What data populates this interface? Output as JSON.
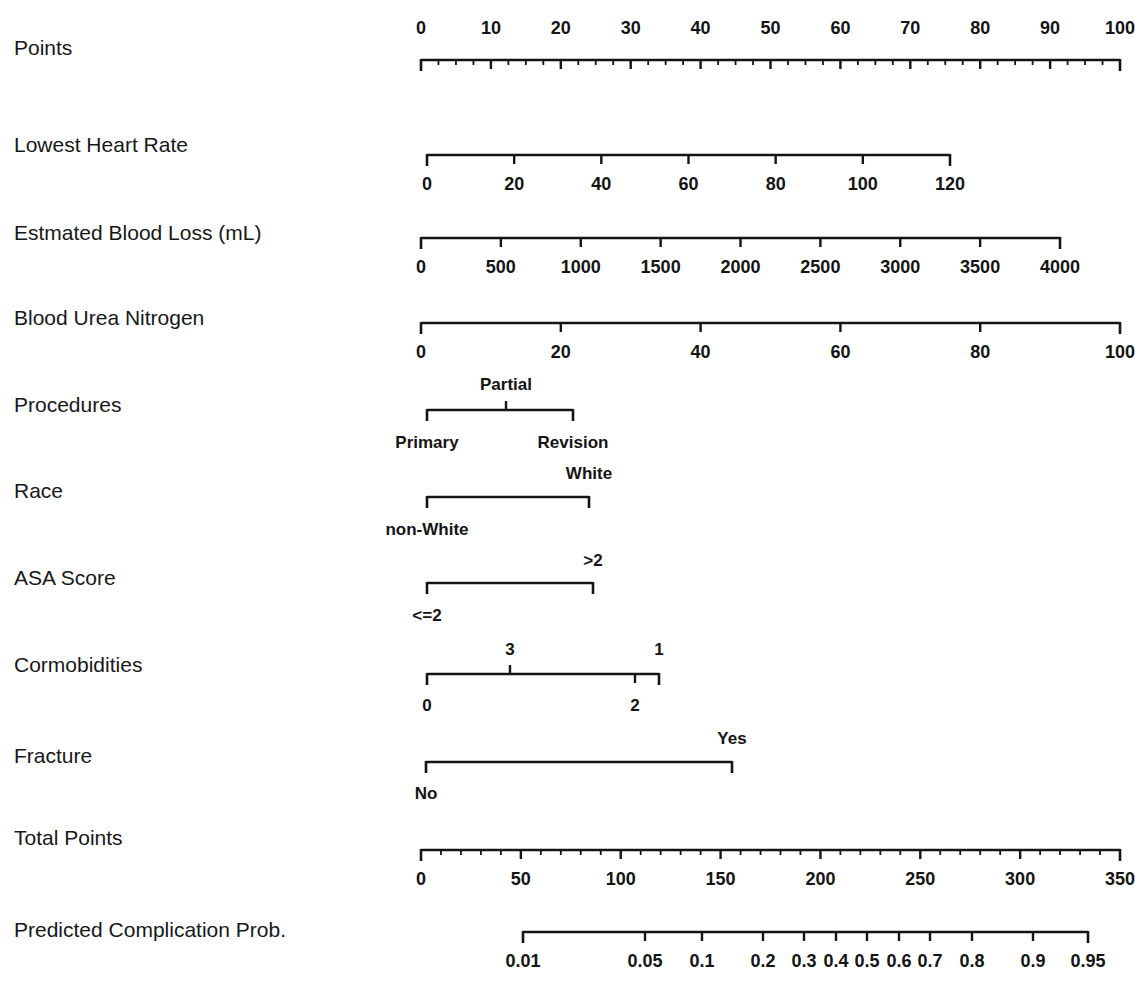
{
  "figure": {
    "background_color": "#ffffff",
    "ink_color": "#141414",
    "width": 1135,
    "height": 989
  },
  "rows": [
    {
      "key": "points",
      "label": "Points",
      "label_x": 14,
      "label_y": 55,
      "axis_y": 60,
      "tick_dir": "down",
      "tick_label_y": 34,
      "scale": {
        "type": "linear",
        "x0": 421,
        "x1": 1120,
        "v0": 0,
        "v1": 100
      },
      "major_ticks": [
        0,
        10,
        20,
        30,
        40,
        50,
        60,
        70,
        80,
        90,
        100
      ],
      "major_tick_labels": [
        "0",
        "10",
        "20",
        "30",
        "40",
        "50",
        "60",
        "70",
        "80",
        "90",
        "100"
      ],
      "minor_step": 2.5,
      "caps": "both"
    },
    {
      "key": "lowest-heart-rate",
      "label": "Lowest Heart Rate",
      "label_x": 14,
      "label_y": 152,
      "axis_y": 155,
      "tick_dir": "down",
      "tick_label_y": 190,
      "scale": {
        "type": "linear",
        "x0": 427,
        "x1": 950,
        "v0": 0,
        "v1": 120
      },
      "major_ticks": [
        0,
        20,
        40,
        60,
        80,
        100,
        120
      ],
      "major_tick_labels": [
        "0",
        "20",
        "40",
        "60",
        "80",
        "100",
        "120"
      ],
      "minor_step": 0,
      "caps": "both"
    },
    {
      "key": "estimated-blood-loss",
      "label": "Estmated Blood Loss (mL)",
      "label_x": 14,
      "label_y": 240,
      "axis_y": 238,
      "tick_dir": "down",
      "tick_label_y": 273,
      "scale": {
        "type": "linear",
        "x0": 421,
        "x1": 1060,
        "v0": 0,
        "v1": 4000
      },
      "major_ticks": [
        0,
        500,
        1000,
        1500,
        2000,
        2500,
        3000,
        3500,
        4000
      ],
      "major_tick_labels": [
        "0",
        "500",
        "1000",
        "1500",
        "2000",
        "2500",
        "3000",
        "3500",
        "4000"
      ],
      "minor_step": 0,
      "caps": "both"
    },
    {
      "key": "blood-urea-nitrogen",
      "label": "Blood Urea Nitrogen",
      "label_x": 14,
      "label_y": 325,
      "axis_y": 323,
      "tick_dir": "down",
      "tick_label_y": 358,
      "scale": {
        "type": "linear",
        "x0": 421,
        "x1": 1120,
        "v0": 0,
        "v1": 100
      },
      "major_ticks": [
        0,
        20,
        40,
        60,
        80,
        100
      ],
      "major_tick_labels": [
        "0",
        "20",
        "40",
        "60",
        "80",
        "100"
      ],
      "minor_step": 0,
      "caps": "both"
    },
    {
      "key": "procedures",
      "label": "Procedures",
      "label_x": 14,
      "label_y": 412,
      "axis_y": 410,
      "tick_dir": "mixed",
      "caps": "both",
      "categories": [
        {
          "text": "Primary",
          "x": 427,
          "side": "below",
          "anchor": "middle",
          "tick": true
        },
        {
          "text": "Partial",
          "x": 506,
          "side": "above",
          "anchor": "middle",
          "tick": true
        },
        {
          "text": "Revision",
          "x": 573,
          "side": "below",
          "anchor": "middle",
          "tick": true
        }
      ],
      "cat_label_above_y": 390,
      "cat_label_below_y": 448
    },
    {
      "key": "race",
      "label": "Race",
      "label_x": 14,
      "label_y": 498,
      "axis_y": 497,
      "tick_dir": "mixed",
      "caps": "both",
      "categories": [
        {
          "text": "non-White",
          "x": 427,
          "side": "below",
          "anchor": "middle",
          "tick": true
        },
        {
          "text": "White",
          "x": 589,
          "side": "above",
          "anchor": "middle",
          "tick": true
        }
      ],
      "cat_label_above_y": 479,
      "cat_label_below_y": 535
    },
    {
      "key": "asa-score",
      "label": "ASA Score",
      "label_x": 14,
      "label_y": 585,
      "axis_y": 583,
      "tick_dir": "mixed",
      "caps": "both",
      "categories": [
        {
          "text": "<=2",
          "x": 427,
          "side": "below",
          "anchor": "middle",
          "tick": true
        },
        {
          "text": ">2",
          "x": 593,
          "side": "above",
          "anchor": "middle",
          "tick": true
        }
      ],
      "cat_label_above_y": 566,
      "cat_label_below_y": 621
    },
    {
      "key": "cormobidities",
      "label": "Cormobidities",
      "label_x": 14,
      "label_y": 672,
      "axis_y": 674,
      "tick_dir": "mixed",
      "caps": "both",
      "categories": [
        {
          "text": "0",
          "x": 427,
          "side": "below",
          "anchor": "middle",
          "tick": true
        },
        {
          "text": "3",
          "x": 510,
          "side": "above",
          "anchor": "middle",
          "tick": true
        },
        {
          "text": "2",
          "x": 635,
          "side": "below",
          "anchor": "middle",
          "tick": true
        },
        {
          "text": "1",
          "x": 659,
          "side": "above",
          "anchor": "middle",
          "tick": true
        }
      ],
      "cat_label_above_y": 655,
      "cat_label_below_y": 711
    },
    {
      "key": "fracture",
      "label": "Fracture",
      "label_x": 14,
      "label_y": 763,
      "axis_y": 762,
      "tick_dir": "mixed",
      "caps": "both",
      "categories": [
        {
          "text": "No",
          "x": 426,
          "side": "below",
          "anchor": "middle",
          "tick": true
        },
        {
          "text": "Yes",
          "x": 732,
          "side": "above",
          "anchor": "middle",
          "tick": true
        }
      ],
      "cat_label_above_y": 744,
      "cat_label_below_y": 799
    },
    {
      "key": "total-points",
      "label": "Total Points",
      "label_x": 14,
      "label_y": 845,
      "axis_y": 850,
      "tick_dir": "down",
      "tick_label_y": 885,
      "scale": {
        "type": "linear",
        "x0": 421,
        "x1": 1120,
        "v0": 0,
        "v1": 350
      },
      "major_ticks": [
        0,
        50,
        100,
        150,
        200,
        250,
        300,
        350
      ],
      "major_tick_labels": [
        "0",
        "50",
        "100",
        "150",
        "200",
        "250",
        "300",
        "350"
      ],
      "minor_step": 10,
      "caps": "both"
    },
    {
      "key": "predicted-complication-prob",
      "label": "Predicted Complication Prob.",
      "label_x": 14,
      "label_y": 937,
      "axis_y": 932,
      "tick_dir": "down",
      "tick_label_y": 967,
      "scale": {
        "type": "explicit",
        "x0": 523,
        "x1": 1088
      },
      "explicit_ticks": [
        {
          "value": 0.01,
          "label": "0.01",
          "x": 523
        },
        {
          "value": 0.05,
          "label": "0.05",
          "x": 645
        },
        {
          "value": 0.1,
          "label": "0.1",
          "x": 702
        },
        {
          "value": 0.2,
          "label": "0.2",
          "x": 763
        },
        {
          "value": 0.3,
          "label": "0.3",
          "x": 804
        },
        {
          "value": 0.4,
          "label": "0.4",
          "x": 836
        },
        {
          "value": 0.5,
          "label": "0.5",
          "x": 867
        },
        {
          "value": 0.6,
          "label": "0.6",
          "x": 899
        },
        {
          "value": 0.7,
          "label": "0.7",
          "x": 930
        },
        {
          "value": 0.8,
          "label": "0.8",
          "x": 972
        },
        {
          "value": 0.9,
          "label": "0.9",
          "x": 1033
        },
        {
          "value": 0.95,
          "label": "0.95",
          "x": 1088
        }
      ],
      "caps": "both"
    }
  ],
  "chart_data": {
    "type": "nomogram",
    "grid": false,
    "legend": "none",
    "axes": [
      {
        "name": "Points",
        "kind": "points",
        "range": [
          0,
          100
        ],
        "ticks": [
          0,
          10,
          20,
          30,
          40,
          50,
          60,
          70,
          80,
          90,
          100
        ],
        "minor_tick_step": 2.5
      },
      {
        "name": "Lowest Heart Rate",
        "kind": "continuous",
        "range": [
          0,
          120
        ],
        "ticks": [
          0,
          20,
          40,
          60,
          80,
          100,
          120
        ],
        "points_at_ticks": [
          0,
          15.0,
          30.0,
          45.0,
          60.0,
          75.0,
          90.0
        ],
        "unit": "bpm"
      },
      {
        "name": "Estmated Blood Loss (mL)",
        "kind": "continuous",
        "range": [
          0,
          4000
        ],
        "ticks": [
          0,
          500,
          1000,
          1500,
          2000,
          2500,
          3000,
          3500,
          4000
        ],
        "points_at_ticks": [
          0,
          11.4,
          22.9,
          34.3,
          45.7,
          57.2,
          68.6,
          80.0,
          91.4
        ],
        "unit": "mL"
      },
      {
        "name": "Blood Urea Nitrogen",
        "kind": "continuous",
        "range": [
          0,
          100
        ],
        "ticks": [
          0,
          20,
          40,
          60,
          80,
          100
        ],
        "points_at_ticks": [
          0,
          20,
          40,
          60,
          80,
          100
        ],
        "unit": "mg/dL"
      },
      {
        "name": "Procedures",
        "kind": "categorical",
        "levels": [
          "Primary",
          "Partial",
          "Revision"
        ],
        "points_at_levels": [
          0,
          11.4,
          21.0
        ]
      },
      {
        "name": "Race",
        "kind": "categorical",
        "levels": [
          "non-White",
          "White"
        ],
        "points_at_levels": [
          0,
          23.2
        ]
      },
      {
        "name": "ASA Score",
        "kind": "categorical",
        "levels": [
          "<=2",
          ">2"
        ],
        "points_at_levels": [
          0,
          23.7
        ]
      },
      {
        "name": "Cormobidities",
        "kind": "categorical",
        "levels": [
          "0",
          "3",
          "2",
          "1"
        ],
        "points_at_levels": [
          0,
          11.9,
          29.8,
          33.2
        ]
      },
      {
        "name": "Fracture",
        "kind": "categorical",
        "levels": [
          "No",
          "Yes"
        ],
        "points_at_levels": [
          0,
          43.8
        ]
      },
      {
        "name": "Total Points",
        "kind": "total",
        "range": [
          0,
          350
        ],
        "ticks": [
          0,
          50,
          100,
          150,
          200,
          250,
          300,
          350
        ],
        "minor_tick_step": 10
      },
      {
        "name": "Predicted Complication Prob.",
        "kind": "probability",
        "scale": "logit",
        "ticks": [
          0.01,
          0.05,
          0.1,
          0.2,
          0.3,
          0.4,
          0.5,
          0.6,
          0.7,
          0.8,
          0.9,
          0.95
        ],
        "tick_labels": [
          "0.01",
          "0.05",
          "0.1",
          "0.2",
          "0.3",
          "0.4",
          "0.5",
          "0.6",
          "0.7",
          "0.8",
          "0.9",
          "0.95"
        ],
        "total_points_at_ticks": [
          95,
          156,
          185,
          216,
          237,
          253,
          269,
          285,
          301,
          322,
          353,
          381
        ]
      }
    ]
  }
}
